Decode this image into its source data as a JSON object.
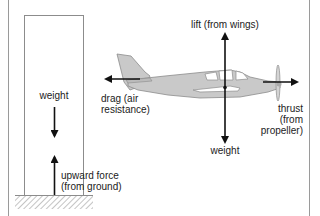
{
  "figure": {
    "colors": {
      "border": "#9a9a9a",
      "outline": "#8c8c8c",
      "arrow": "#111111",
      "plane_fill": "#c9c9c9",
      "text": "#222222"
    }
  },
  "building": {
    "labels": {
      "weight": "weight",
      "upward_force_line1": "upward force",
      "upward_force_line2": "(from ground)"
    }
  },
  "airplane": {
    "labels": {
      "lift": "lift (from wings)",
      "weight": "weight",
      "drag_line1": "drag (air",
      "drag_line2": "resistance)",
      "thrust_line1": "thrust",
      "thrust_line2": "(from",
      "thrust_line3": "propeller)"
    }
  }
}
